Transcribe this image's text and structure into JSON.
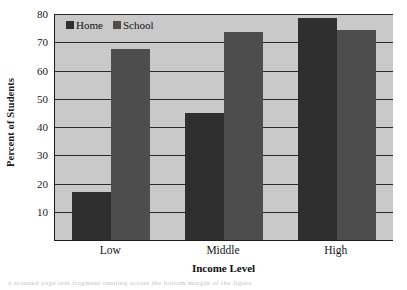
{
  "chart_data": {
    "type": "bar",
    "title": "",
    "xlabel": "Income Level",
    "ylabel": "Percent of Students",
    "categories": [
      "Low",
      "Middle",
      "High"
    ],
    "series": [
      {
        "name": "Home",
        "color": "#2f2f2f",
        "values": [
          17,
          45,
          78.5
        ]
      },
      {
        "name": "School",
        "color": "#4d4d4d",
        "values": [
          67.5,
          73.5,
          74.5
        ]
      }
    ],
    "ylim": [
      0,
      80
    ],
    "yticks": [
      10,
      20,
      30,
      40,
      50,
      60,
      70,
      80
    ],
    "ytick_labels": [
      "10",
      "20",
      "30",
      "40",
      "50",
      "60",
      "70",
      "80"
    ],
    "grid": true,
    "grid_axis": "y",
    "legend": {
      "position": "top-left",
      "entries": [
        "Home",
        "School"
      ]
    },
    "plot_background": "#c9c9c9",
    "figure_background": "#ffffff"
  },
  "artifact": {
    "bottom_text": "a scanned page text fragment running across the bottom margin of the figure"
  }
}
